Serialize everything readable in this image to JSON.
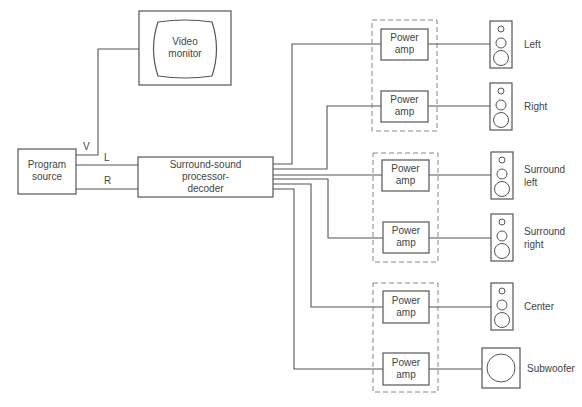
{
  "diagram": {
    "program_source": {
      "line1": "Program",
      "line2": "source"
    },
    "video_monitor": {
      "line1": "Video",
      "line2": "monitor"
    },
    "processor": {
      "line1": "Surround-sound",
      "line2": "processor-",
      "line3": "decoder"
    },
    "signals": {
      "video": "V",
      "left": "L",
      "right": "R"
    },
    "amplifiers": [
      {
        "line1": "Power",
        "line2": "amp"
      },
      {
        "line1": "Power",
        "line2": "amp"
      },
      {
        "line1": "Power",
        "line2": "amp"
      },
      {
        "line1": "Power",
        "line2": "amp"
      },
      {
        "line1": "Power",
        "line2": "amp"
      },
      {
        "line1": "Power",
        "line2": "amp"
      }
    ],
    "speakers": [
      {
        "line1": "Left",
        "line2": ""
      },
      {
        "line1": "Right",
        "line2": ""
      },
      {
        "line1": "Surround",
        "line2": "left"
      },
      {
        "line1": "Surround",
        "line2": "right"
      },
      {
        "line1": "Center",
        "line2": ""
      },
      {
        "line1": "Subwoofer",
        "line2": ""
      }
    ]
  }
}
